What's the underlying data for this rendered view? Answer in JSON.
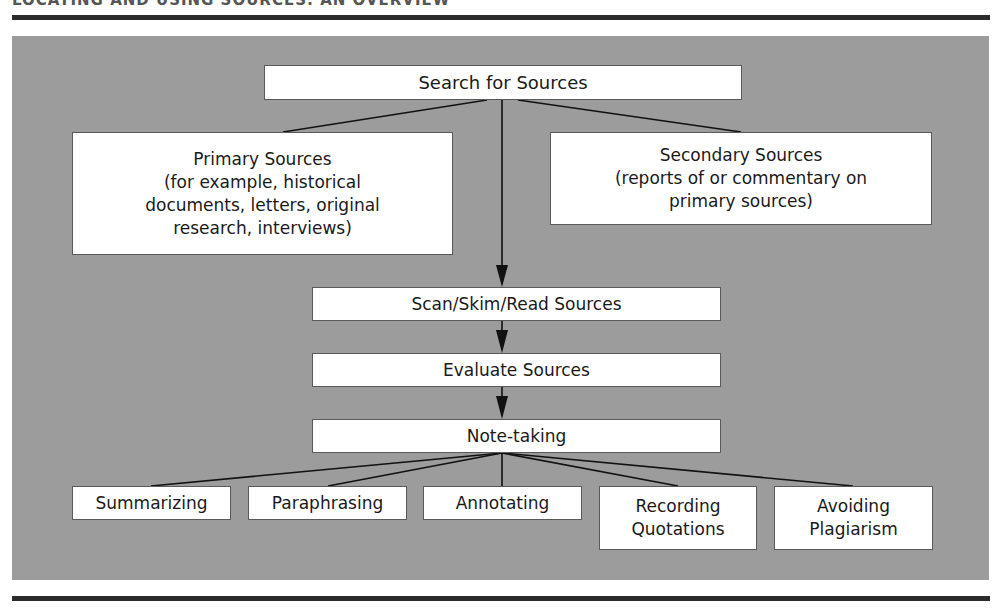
{
  "header": {
    "title": "LOCATING AND USING SOURCES: AN OVERVIEW"
  },
  "diagram": {
    "root": {
      "label": "Search for Sources"
    },
    "branches": {
      "primary": {
        "label": "Primary Sources\n(for example, historical\ndocuments, letters, original\nresearch, interviews)"
      },
      "secondary": {
        "label": "Secondary Sources\n(reports of or commentary on\nprimary sources)"
      }
    },
    "steps": [
      {
        "label": "Scan/Skim/Read Sources"
      },
      {
        "label": "Evaluate Sources"
      },
      {
        "label": "Note-taking"
      }
    ],
    "note_taking_methods": [
      {
        "label": "Summarizing"
      },
      {
        "label": "Paraphrasing"
      },
      {
        "label": "Annotating"
      },
      {
        "label": "Recording\nQuotations"
      },
      {
        "label": "Avoiding\nPlagiarism"
      }
    ]
  },
  "colors": {
    "panel": "#9c9c9c",
    "rule": "#2b2b2b",
    "box": "#ffffff",
    "line": "#111111"
  }
}
